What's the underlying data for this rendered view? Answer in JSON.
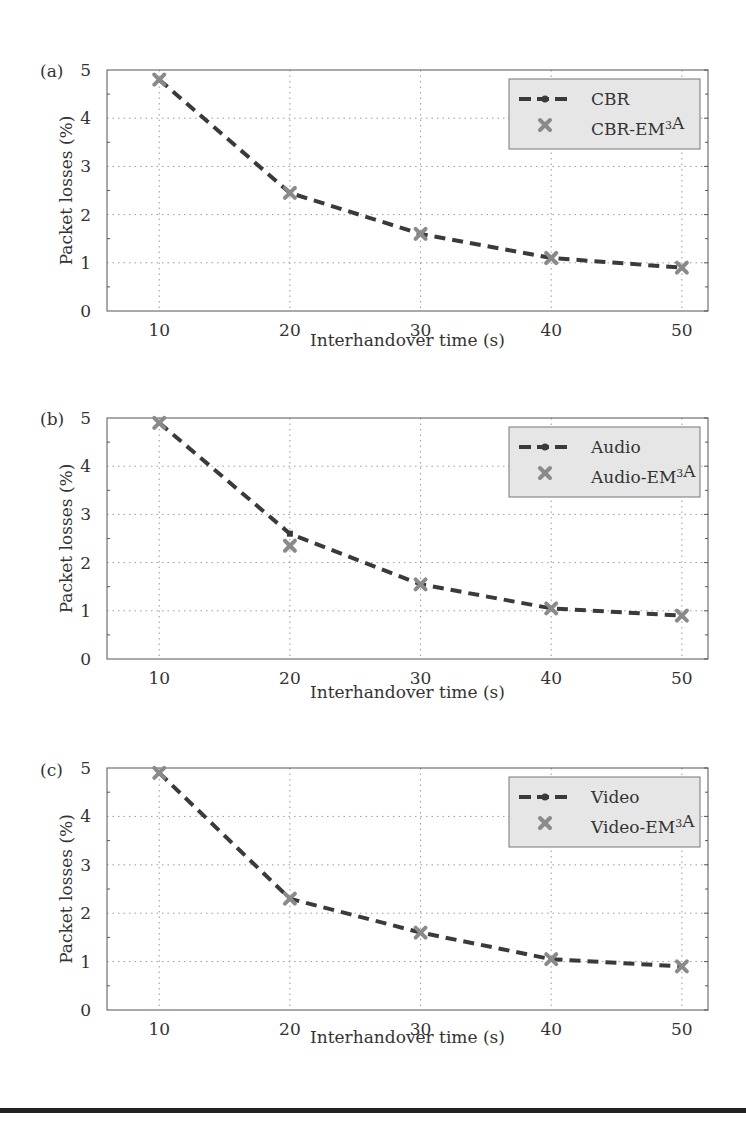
{
  "chart_data": [
    {
      "type": "line",
      "panel_label": "(a)",
      "title": "",
      "xlabel": "Interhandover time (s)",
      "ylabel": "Packet losses (%)",
      "x": [
        10,
        20,
        30,
        40,
        50
      ],
      "xticks": [
        "10",
        "20",
        "30",
        "40",
        "50"
      ],
      "yticks": [
        "0",
        "1",
        "2",
        "3",
        "4",
        "5"
      ],
      "ylim": [
        0,
        5
      ],
      "xlim": [
        6,
        52
      ],
      "grid": true,
      "legend_position": "upper right",
      "series": [
        {
          "name": "CBR",
          "style": "dashed",
          "values": [
            4.8,
            2.45,
            1.6,
            1.1,
            0.9
          ]
        },
        {
          "name": "CBR-EM³A",
          "style": "x-marker",
          "values": [
            4.8,
            2.45,
            1.6,
            1.1,
            0.9
          ]
        }
      ]
    },
    {
      "type": "line",
      "panel_label": "(b)",
      "title": "",
      "xlabel": "Interhandover time (s)",
      "ylabel": "Packet losses (%)",
      "x": [
        10,
        20,
        30,
        40,
        50
      ],
      "xticks": [
        "10",
        "20",
        "30",
        "40",
        "50"
      ],
      "yticks": [
        "0",
        "1",
        "2",
        "3",
        "4",
        "5"
      ],
      "ylim": [
        0,
        5
      ],
      "xlim": [
        6,
        52
      ],
      "grid": true,
      "legend_position": "upper right",
      "series": [
        {
          "name": "Audio",
          "style": "dashed",
          "values": [
            4.9,
            2.6,
            1.55,
            1.05,
            0.9
          ]
        },
        {
          "name": "Audio-EM³A",
          "style": "x-marker",
          "values": [
            4.9,
            2.35,
            1.55,
            1.05,
            0.9
          ]
        }
      ]
    },
    {
      "type": "line",
      "panel_label": "(c)",
      "title": "",
      "xlabel": "Interhandover time (s)",
      "ylabel": "Packet losses (%)",
      "x": [
        10,
        20,
        30,
        40,
        50
      ],
      "xticks": [
        "10",
        "20",
        "30",
        "40",
        "50"
      ],
      "yticks": [
        "0",
        "1",
        "2",
        "3",
        "4",
        "5"
      ],
      "ylim": [
        0,
        5
      ],
      "xlim": [
        6,
        52
      ],
      "grid": true,
      "legend_position": "upper right",
      "series": [
        {
          "name": "Video",
          "style": "dashed",
          "values": [
            4.9,
            2.3,
            1.6,
            1.05,
            0.9
          ]
        },
        {
          "name": "Video-EM³A",
          "style": "x-marker",
          "values": [
            4.9,
            2.3,
            1.6,
            1.05,
            0.9
          ]
        }
      ]
    }
  ],
  "colors": {
    "line": "#3a3a3a",
    "marker": "#8a8a8a",
    "grid": "#9a9a9a",
    "legend_bg": "#e6e6e6",
    "axis": "#555555"
  }
}
